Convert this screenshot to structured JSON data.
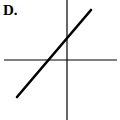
{
  "figure": {
    "label": "D.",
    "axes": {
      "x_axis": {
        "x1": 4,
        "y1": 60,
        "x2": 117,
        "y2": 60
      },
      "y_axis": {
        "x1": 67,
        "y1": 0,
        "x2": 67,
        "y2": 120
      }
    },
    "line": {
      "x1": 17,
      "y1": 97,
      "x2": 91,
      "y2": 10,
      "slope": "positive",
      "y_intercept": "positive",
      "x_intercept": "negative"
    },
    "colors": {
      "stroke": "#000000",
      "background": "#ffffff"
    }
  }
}
